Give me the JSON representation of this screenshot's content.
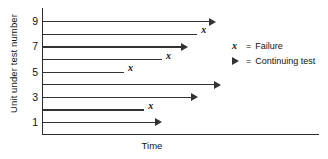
{
  "chart_data": {
    "type": "bar",
    "title": "",
    "xlabel": "Time",
    "ylabel": "Unit under test number",
    "grid": false,
    "legend_position": "right",
    "xlim": [
      0,
      1
    ],
    "ylim": [
      0,
      10
    ],
    "categories": [
      "1",
      "2",
      "3",
      "4",
      "5",
      "6",
      "7",
      "8",
      "9"
    ],
    "y_tick_labels": [
      "1",
      "3",
      "5",
      "7",
      "9"
    ],
    "values": [
      0.47,
      0.4,
      0.61,
      0.7,
      0.32,
      0.47,
      0.57,
      0.61,
      0.68
    ],
    "series": [
      {
        "name": "Test duration",
        "values": [
          0.47,
          0.4,
          0.61,
          0.7,
          0.32,
          0.47,
          0.57,
          0.61,
          0.68
        ]
      }
    ],
    "points": [
      {
        "unit": "9",
        "length": 0.68,
        "end_marker": "arrow",
        "outcome": "Continuing test"
      },
      {
        "unit": "8",
        "length": 0.61,
        "end_marker": "x",
        "outcome": "Failure"
      },
      {
        "unit": "7",
        "length": 0.57,
        "end_marker": "arrow",
        "outcome": "Continuing test"
      },
      {
        "unit": "6",
        "length": 0.47,
        "end_marker": "x",
        "outcome": "Failure"
      },
      {
        "unit": "5",
        "length": 0.32,
        "end_marker": "x",
        "outcome": "Failure"
      },
      {
        "unit": "4",
        "length": 0.7,
        "end_marker": "arrow",
        "outcome": "Continuing test"
      },
      {
        "unit": "3",
        "length": 0.61,
        "end_marker": "arrow",
        "outcome": "Continuing test"
      },
      {
        "unit": "2",
        "length": 0.4,
        "end_marker": "x",
        "outcome": "Failure"
      },
      {
        "unit": "1",
        "length": 0.47,
        "end_marker": "arrow",
        "outcome": "Continuing test"
      }
    ],
    "annotations": []
  },
  "axes": {
    "y_title": "Unit under test number",
    "x_title": "Time",
    "ticks": [
      {
        "label": "9",
        "unit": 9
      },
      {
        "label": "7",
        "unit": 7
      },
      {
        "label": "5",
        "unit": 5
      },
      {
        "label": "3",
        "unit": 3
      },
      {
        "label": "1",
        "unit": 1
      }
    ]
  },
  "legend": {
    "items": [
      {
        "key": "x",
        "key_icon": "italic-x-marker",
        "equals": "=",
        "label": "Failure"
      },
      {
        "key": "▶",
        "key_icon": "right-arrow-marker",
        "equals": "=",
        "label": "Continuing test"
      }
    ]
  },
  "colors": {
    "line": "#333333",
    "axis": "#2b2b2b",
    "text": "#111111",
    "background": "#ffffff"
  }
}
